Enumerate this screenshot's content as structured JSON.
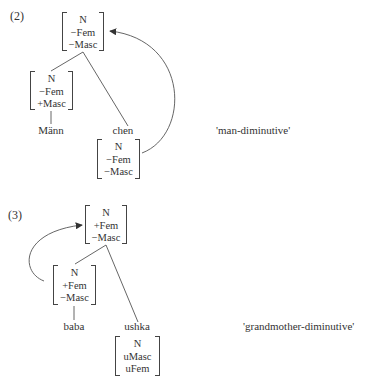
{
  "examples": [
    {
      "number": "(2)",
      "gloss": "'man-diminutive'",
      "root": {
        "features": [
          "N",
          "−Fem",
          "−Masc"
        ]
      },
      "left": {
        "features": [
          "N",
          "−Fem",
          "+Masc"
        ],
        "word": "Männ"
      },
      "right": {
        "features": [
          "N",
          "−Fem",
          "−Masc"
        ],
        "word": "chen"
      },
      "arrow": "from right (chen) matrix to root matrix"
    },
    {
      "number": "(3)",
      "gloss": "'grandmother-diminutive'",
      "root": {
        "features": [
          "N",
          "+Fem",
          "−Masc"
        ]
      },
      "left": {
        "features": [
          "N",
          "+Fem",
          "−Masc"
        ],
        "word": "baba"
      },
      "right": {
        "features": [
          "N",
          "uMasc",
          "uFem"
        ],
        "word": "ushka"
      },
      "arrow": "from left (baba) matrix to root matrix"
    }
  ],
  "colors": {
    "ink": "#333333",
    "line": "#555555"
  }
}
